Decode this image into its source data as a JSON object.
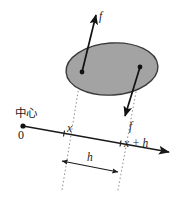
{
  "figure": {
    "background_color": "#ffffff",
    "width": 176,
    "height": 199,
    "labels": {
      "center": "中心",
      "origin": "0",
      "x": "x",
      "x_plus_h": "x + h",
      "h": "h",
      "force_up": "f",
      "force_down": "f"
    },
    "colors": {
      "region_fill": "#a3a3a3",
      "region_stroke": "#3a3a3a",
      "axis": "#1a1a1a",
      "vector": "#111111",
      "guide_dotted": "#8a8a8a",
      "text": "#1a1a1a"
    },
    "geometry": {
      "region": {
        "shape": "ellipse",
        "cx": 112,
        "cy": 69,
        "rx": 46,
        "ry": 26,
        "rotation_deg": -4
      },
      "axis": {
        "x1": 23,
        "y1": 126,
        "x2": 171,
        "y2": 153,
        "origin_dot": [
          23,
          126
        ],
        "tick_x": [
          64,
          133
        ],
        "tick_x_plus_h": [
          120,
          144
        ]
      },
      "point_left": [
        82,
        72
      ],
      "point_right": [
        140,
        67
      ],
      "vector_up": {
        "from": [
          82,
          72
        ],
        "to": [
          96,
          13
        ]
      },
      "vector_down": {
        "from": [
          140,
          67
        ],
        "to": [
          124,
          118
        ]
      },
      "h_span": {
        "from": [
          62,
          161
        ],
        "to": [
          118,
          172
        ]
      }
    }
  }
}
